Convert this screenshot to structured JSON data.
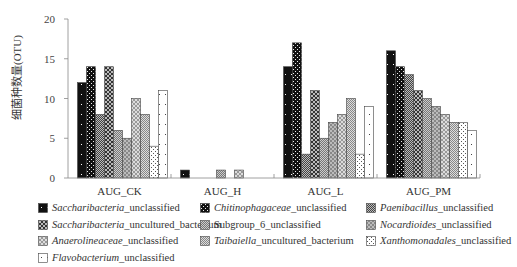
{
  "chart_data": {
    "type": "bar",
    "title": "",
    "xlabel": "",
    "ylabel": "细菌种数量(OTU)",
    "ylim": [
      0,
      20
    ],
    "yticks": [
      0,
      5,
      10,
      15,
      20
    ],
    "grid": false,
    "legend_position": "bottom",
    "categories": [
      "AUG_CK",
      "AUG_H",
      "AUG_L",
      "AUG_PM"
    ],
    "series": [
      {
        "name": "Saccharibacteria_unclassified",
        "italic": "Saccharibacteria",
        "suffix": "_unclassified",
        "values": [
          12,
          1,
          14,
          16
        ]
      },
      {
        "name": "Chitinophagaceae_unclassified",
        "italic": "Chitinophagaceae",
        "suffix": "_unclassified",
        "values": [
          14,
          0,
          17,
          14
        ]
      },
      {
        "name": "Paenibacillus_unclassified",
        "italic": "Paenibacillus",
        "suffix": "_unclassified",
        "values": [
          8,
          0,
          3,
          13
        ]
      },
      {
        "name": "Saccharibacteria_uncultured_bacterium",
        "italic": "Saccharibacteria",
        "suffix": "_uncultured_bacterium",
        "values": [
          14,
          0,
          11,
          11
        ]
      },
      {
        "name": "Subgroup_6_unclassified",
        "italic": "",
        "suffix": "Subgroup_6_unclassified",
        "values": [
          6,
          1,
          5,
          10
        ]
      },
      {
        "name": "Nocardioides_unclassified",
        "italic": "Nocardioides",
        "suffix": "_unclassified",
        "values": [
          5,
          0,
          7,
          9
        ]
      },
      {
        "name": "Anaerolineaceae_unclassified",
        "italic": "Anaerolineaceae",
        "suffix": "_unclassified",
        "values": [
          10,
          1,
          8,
          8
        ]
      },
      {
        "name": "Taibaiella_uncultured_bacterium",
        "italic": "Taibaiella",
        "suffix": "_uncultured_bacterium",
        "values": [
          8,
          0,
          10,
          7
        ]
      },
      {
        "name": "Xanthomonadales_unclassified",
        "italic": "Xanthomonadales",
        "suffix": "_unclassified",
        "values": [
          4,
          0,
          3,
          7
        ]
      },
      {
        "name": "Flavobacterium_unclassified",
        "italic": "Flavobacterium",
        "suffix": "_unclassified",
        "values": [
          11,
          0,
          9,
          6
        ]
      }
    ]
  }
}
